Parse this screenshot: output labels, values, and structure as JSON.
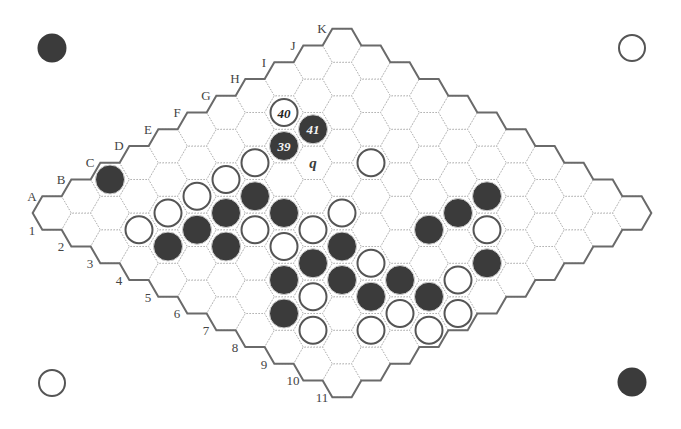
{
  "board": {
    "size": 11,
    "column_labels": [
      "A",
      "B",
      "C",
      "D",
      "E",
      "F",
      "G",
      "H",
      "I",
      "J",
      "K"
    ],
    "row_labels": [
      "1",
      "2",
      "3",
      "4",
      "5",
      "6",
      "7",
      "8",
      "9",
      "10",
      "11"
    ],
    "colors": {
      "background": "#ffffff",
      "black_stone": "#3b3b3b",
      "white_stone": "#ffffff",
      "stone_outline": "#555555",
      "border": "#6a6a6a",
      "grid": "#b4b4b4",
      "label": "#444444"
    }
  },
  "stones": [
    {
      "cell": "C1",
      "color": "black"
    },
    {
      "cell": "H2",
      "color": "white",
      "number": "40"
    },
    {
      "cell": "G3",
      "color": "black",
      "number": "39"
    },
    {
      "cell": "H3",
      "color": "black",
      "number": "41"
    },
    {
      "cell": "F3",
      "color": "white"
    },
    {
      "cell": "E3",
      "color": "white"
    },
    {
      "cell": "D3",
      "color": "white"
    },
    {
      "cell": "C3",
      "color": "white"
    },
    {
      "cell": "B3",
      "color": "white"
    },
    {
      "cell": "E4",
      "color": "black"
    },
    {
      "cell": "D4",
      "color": "black"
    },
    {
      "cell": "C4",
      "color": "black"
    },
    {
      "cell": "B4",
      "color": "black"
    },
    {
      "cell": "H5",
      "color": "white"
    },
    {
      "cell": "E5",
      "color": "black"
    },
    {
      "cell": "D5",
      "color": "white"
    },
    {
      "cell": "C5",
      "color": "black"
    },
    {
      "cell": "F6",
      "color": "white"
    },
    {
      "cell": "E6",
      "color": "white"
    },
    {
      "cell": "D6",
      "color": "white"
    },
    {
      "cell": "E7",
      "color": "black"
    },
    {
      "cell": "D7",
      "color": "black"
    },
    {
      "cell": "C7",
      "color": "black"
    },
    {
      "cell": "I8",
      "color": "black"
    },
    {
      "cell": "H8",
      "color": "black"
    },
    {
      "cell": "G8",
      "color": "black"
    },
    {
      "cell": "E8",
      "color": "white"
    },
    {
      "cell": "D8",
      "color": "black"
    },
    {
      "cell": "C8",
      "color": "white"
    },
    {
      "cell": "B8",
      "color": "black"
    },
    {
      "cell": "H9",
      "color": "white"
    },
    {
      "cell": "E9",
      "color": "black"
    },
    {
      "cell": "D9",
      "color": "black"
    },
    {
      "cell": "B9",
      "color": "white"
    },
    {
      "cell": "G10",
      "color": "black"
    },
    {
      "cell": "F10",
      "color": "white"
    },
    {
      "cell": "E10",
      "color": "black"
    },
    {
      "cell": "D10",
      "color": "white"
    },
    {
      "cell": "C10",
      "color": "white"
    },
    {
      "cell": "E11",
      "color": "white"
    },
    {
      "cell": "D11",
      "color": "white"
    }
  ],
  "markers": [
    {
      "cell": "G4",
      "label": "q"
    }
  ],
  "corner_indicators": [
    {
      "position": "top-left",
      "color": "black"
    },
    {
      "position": "top-right",
      "color": "white"
    },
    {
      "position": "bottom-left",
      "color": "white"
    },
    {
      "position": "bottom-right",
      "color": "black"
    }
  ]
}
